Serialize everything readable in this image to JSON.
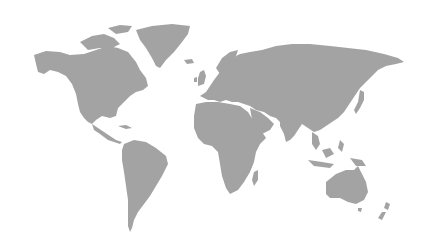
{
  "map": {
    "title": "World map",
    "land_color": "#a3a3a3",
    "background_color": "#ffffff",
    "regions": [
      {
        "name": "North America"
      },
      {
        "name": "Greenland"
      },
      {
        "name": "Central America"
      },
      {
        "name": "South America"
      },
      {
        "name": "Europe"
      },
      {
        "name": "Africa"
      },
      {
        "name": "Madagascar"
      },
      {
        "name": "Asia"
      },
      {
        "name": "Arabian Peninsula"
      },
      {
        "name": "India"
      },
      {
        "name": "Japan"
      },
      {
        "name": "Southeast Asia"
      },
      {
        "name": "Indonesia"
      },
      {
        "name": "Australia"
      },
      {
        "name": "New Zealand"
      },
      {
        "name": "United Kingdom"
      },
      {
        "name": "Iceland"
      }
    ]
  }
}
